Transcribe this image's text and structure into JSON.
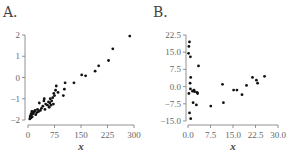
{
  "chart_data": [
    {
      "id": "A",
      "title": "A.",
      "type": "scatter",
      "xlabel": "x",
      "ylabel": "",
      "xlim": [
        0,
        300
      ],
      "ylim": [
        -2,
        2
      ],
      "xticks": [
        "0",
        "75",
        "150",
        "225",
        "300"
      ],
      "yticks": [
        "2",
        "1",
        "0",
        "−1",
        "−2"
      ],
      "grid": false,
      "points": [
        [
          5,
          -1.95
        ],
        [
          6,
          -1.85
        ],
        [
          7,
          -1.8
        ],
        [
          8,
          -1.9
        ],
        [
          9,
          -1.7
        ],
        [
          10,
          -1.75
        ],
        [
          11,
          -1.6
        ],
        [
          12,
          -1.85
        ],
        [
          14,
          -1.65
        ],
        [
          15,
          -1.7
        ],
        [
          18,
          -1.6
        ],
        [
          20,
          -1.55
        ],
        [
          22,
          -1.75
        ],
        [
          25,
          -1.65
        ],
        [
          27,
          -1.5
        ],
        [
          30,
          -1.6
        ],
        [
          32,
          -1.2
        ],
        [
          35,
          -1.55
        ],
        [
          38,
          -1.45
        ],
        [
          42,
          -1.35
        ],
        [
          45,
          -1.1
        ],
        [
          46,
          -1.0
        ],
        [
          48,
          -1.5
        ],
        [
          50,
          -1.25
        ],
        [
          55,
          -1.3
        ],
        [
          58,
          -1.15
        ],
        [
          60,
          -1.4
        ],
        [
          62,
          -1.2
        ],
        [
          63,
          -1.0
        ],
        [
          65,
          -1.3
        ],
        [
          67,
          -1.1
        ],
        [
          70,
          -0.95
        ],
        [
          72,
          -1.25
        ],
        [
          73,
          -0.75
        ],
        [
          75,
          -0.85
        ],
        [
          78,
          -0.6
        ],
        [
          80,
          -0.4
        ],
        [
          85,
          -0.7
        ],
        [
          100,
          -0.85
        ],
        [
          103,
          -0.55
        ],
        [
          105,
          -0.25
        ],
        [
          130,
          -0.25
        ],
        [
          152,
          0.12
        ],
        [
          163,
          0.08
        ],
        [
          190,
          0.3
        ],
        [
          200,
          0.55
        ],
        [
          228,
          0.8
        ],
        [
          240,
          1.35
        ],
        [
          288,
          1.95
        ]
      ]
    },
    {
      "id": "B",
      "title": "B.",
      "type": "scatter",
      "xlabel": "x",
      "ylabel": "",
      "xlim": [
        0,
        30
      ],
      "ylim": [
        -15,
        22.5
      ],
      "xticks": [
        "0.0",
        "7.5",
        "15.0",
        "22.5",
        "30.0"
      ],
      "yticks": [
        "22.5",
        "15.0",
        "7.5",
        "0.0",
        "−7.5",
        "−15.0"
      ],
      "grid": false,
      "points": [
        [
          0.5,
          19.5
        ],
        [
          0.3,
          17.5
        ],
        [
          0.2,
          14.5
        ],
        [
          0.8,
          13.0
        ],
        [
          3.5,
          9.0
        ],
        [
          0.9,
          4.0
        ],
        [
          0.7,
          1.5
        ],
        [
          0.8,
          -1.0
        ],
        [
          0.3,
          -3.0
        ],
        [
          1.5,
          -2.0
        ],
        [
          2.0,
          -1.5
        ],
        [
          2.2,
          -2.2
        ],
        [
          3.0,
          -2.5
        ],
        [
          3.2,
          -3.0
        ],
        [
          1.7,
          -7.0
        ],
        [
          2.8,
          -8.0
        ],
        [
          0.5,
          -11.5
        ],
        [
          0.9,
          -14.0
        ],
        [
          7.6,
          -8.5
        ],
        [
          11.5,
          1.0
        ],
        [
          11.8,
          -7.0
        ],
        [
          15.2,
          -1.5
        ],
        [
          16.3,
          -1.5
        ],
        [
          18.0,
          -3.5
        ],
        [
          19.5,
          0.5
        ],
        [
          21.5,
          4.0
        ],
        [
          22.8,
          2.8
        ],
        [
          23.2,
          1.5
        ],
        [
          25.5,
          4.5
        ]
      ]
    }
  ]
}
